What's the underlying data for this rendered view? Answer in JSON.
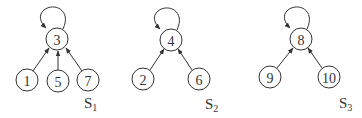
{
  "diagram": {
    "type": "directed-graph",
    "components": [
      {
        "label": "S",
        "subscript": "1",
        "root": "3",
        "children": [
          "1",
          "5",
          "7"
        ],
        "self_loop": "3"
      },
      {
        "label": "S",
        "subscript": "2",
        "root": "4",
        "children": [
          "2",
          "6"
        ],
        "self_loop": "4"
      },
      {
        "label": "S",
        "subscript": "3",
        "root": "8",
        "children": [
          "9",
          "10"
        ],
        "self_loop": "8"
      }
    ],
    "nodes": {
      "n3": "3",
      "n1": "1",
      "n5": "5",
      "n7": "7",
      "n4": "4",
      "n2": "2",
      "n6": "6",
      "n8": "8",
      "n9": "9",
      "n10": "10"
    },
    "edges": [
      {
        "from": "1",
        "to": "3"
      },
      {
        "from": "5",
        "to": "3"
      },
      {
        "from": "7",
        "to": "3"
      },
      {
        "from": "3",
        "to": "3"
      },
      {
        "from": "2",
        "to": "4"
      },
      {
        "from": "6",
        "to": "4"
      },
      {
        "from": "4",
        "to": "4"
      },
      {
        "from": "9",
        "to": "8"
      },
      {
        "from": "10",
        "to": "8"
      },
      {
        "from": "8",
        "to": "8"
      }
    ],
    "labels": {
      "s1": {
        "main": "S",
        "sub": "1"
      },
      "s2": {
        "main": "S",
        "sub": "2"
      },
      "s3": {
        "main": "S",
        "sub": "3"
      }
    }
  }
}
